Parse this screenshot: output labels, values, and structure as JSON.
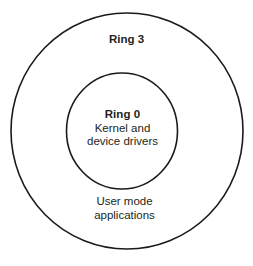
{
  "diagram": {
    "background_color": "#ffffff",
    "stroke_color": "#1a1a1a",
    "text_color": "#231f20",
    "outer_ring": {
      "name": "Ring 3",
      "label": "Ring 3",
      "description_lines": [
        "User mode",
        "applications"
      ],
      "center_x": 127,
      "center_y": 131,
      "radius_x": 116,
      "radius_y": 118
    },
    "inner_ring": {
      "name": "Ring 0",
      "label": "Ring 0",
      "description_lines": [
        "Kernel and",
        "device drivers"
      ],
      "center_x": 122,
      "center_y": 131,
      "radius_x": 55,
      "radius_y": 58
    }
  }
}
